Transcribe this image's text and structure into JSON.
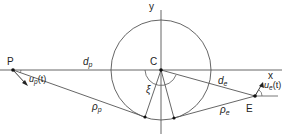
{
  "diagram": {
    "type": "geometry",
    "labels": {
      "pursuer": "P",
      "evader": "E",
      "center": "C",
      "x_axis": "x",
      "y_axis": "y",
      "angle": "ξ",
      "d_p_main": "d",
      "d_p_sub": "p",
      "d_e_main": "d",
      "d_e_sub": "e",
      "rho_p_main": "ρ",
      "rho_p_sub": "p",
      "rho_e_main": "ρ",
      "rho_e_sub": "e",
      "u_p_main": "u",
      "u_p_sub": "p",
      "u_p_arg": "(t)",
      "u_e_main": "u",
      "u_e_sub": "e",
      "u_e_arg": "(t)"
    },
    "points": {
      "P": [
        13,
        70
      ],
      "C": [
        161,
        70
      ],
      "E": [
        255,
        96
      ],
      "tangent_left": [
        145,
        117
      ],
      "tangent_right": [
        174,
        118
      ]
    },
    "circle": {
      "cx": 161,
      "cy": 70,
      "r": 50
    },
    "colors": {
      "stroke": "#555555",
      "text": "#222222",
      "point": "#111111"
    }
  }
}
